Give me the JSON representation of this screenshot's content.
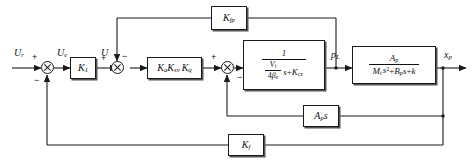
{
  "diagram": {
    "signals": {
      "input": "U",
      "input_sub": "r",
      "error": "U",
      "error_sub": "e",
      "control": "U",
      "pressure": "p",
      "pressure_sub": "L",
      "output": "x",
      "output_sub": "p"
    },
    "blocks": {
      "k1": {
        "name": "K",
        "sub": "1"
      },
      "servo_gain": {
        "ka": "K",
        "ka_sub": "a",
        "ksv": "K",
        "ksv_sub": "sv",
        "kq": "K",
        "kq_sub": "q"
      },
      "hydraulic": {
        "numerator": "1",
        "den_frac_num": "V",
        "den_frac_num_sub": "t",
        "den_frac_den": "4",
        "den_frac_den_beta": "β",
        "den_frac_den_beta_sub": "e",
        "den_s": "s",
        "den_plus": "+",
        "den_kce": "K",
        "den_kce_sub": "ce"
      },
      "mechanical": {
        "num_a": "A",
        "num_a_sub": "p",
        "den_m": "M",
        "den_m_sub": "t",
        "den_s2": "s",
        "den_s2_sup": "2",
        "den_plus1": "+",
        "den_b": "B",
        "den_b_sub": "p",
        "den_s": "s",
        "den_plus2": "+",
        "den_k": "k"
      },
      "kfp": {
        "name": "K",
        "sub": "fp"
      },
      "aps": {
        "name": "A",
        "sub": "p",
        "s": "s"
      },
      "kf": {
        "name": "K",
        "sub": "f"
      }
    },
    "summing_junctions": [
      {
        "id": "sum1",
        "signs": {
          "left": "+",
          "bottom": "−"
        }
      },
      {
        "id": "sum2",
        "signs": {
          "left": "+",
          "top": "−"
        }
      },
      {
        "id": "sum3",
        "signs": {
          "left": "+",
          "bottom": "−"
        }
      }
    ]
  }
}
